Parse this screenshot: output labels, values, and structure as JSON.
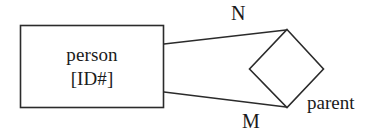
{
  "diagram": {
    "type": "entity-relationship-diagram",
    "entity": {
      "name": "person",
      "key": "[ID#]"
    },
    "relationship": {
      "name": "parent",
      "shape": "diamond"
    },
    "cardinality": {
      "upper": "N",
      "lower": "M"
    },
    "colors": {
      "stroke": "#2b2b2b",
      "background": "#ffffff",
      "text": "#1a1a1a"
    }
  }
}
